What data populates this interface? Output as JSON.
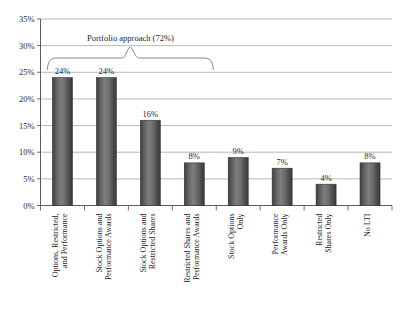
{
  "chart_data": {
    "type": "bar",
    "title": "",
    "subtitle": "",
    "xlabel": "",
    "ylabel": "",
    "ylim": [
      0,
      35
    ],
    "ytick_labels": [
      "0%",
      "5%",
      "10%",
      "15%",
      "20%",
      "25%",
      "30%",
      "35%"
    ],
    "ytick_values": [
      0,
      5,
      10,
      15,
      20,
      25,
      30,
      35
    ],
    "grid": true,
    "legend": "none",
    "categories": [
      "Options, Restricted, and Performance",
      "Stock Options and Performance Awards",
      "Stock Options and Restricted Shares",
      "Restricted Shares and Performance Awards",
      "Stock Options Only",
      "Performance Awards Only",
      "Restricted Shares Only",
      "No LTI"
    ],
    "category_lines": [
      [
        "Options, Restricted,",
        "and Performance"
      ],
      [
        "Stock Options and",
        "Performance Awards"
      ],
      [
        "Stock Options and",
        "Restricted Shares"
      ],
      [
        "Restricted Shares and",
        "Performance Awards"
      ],
      [
        "Stock Options",
        "Only"
      ],
      [
        "Performance",
        "Awards Only"
      ],
      [
        "Restricted",
        "Shares Only"
      ],
      [
        "No LTI"
      ]
    ],
    "values": [
      24,
      24,
      16,
      8,
      9,
      7,
      4,
      8
    ],
    "value_labels": [
      "24%",
      "24%",
      "16%",
      "8%",
      "9%",
      "7%",
      "4%",
      "8%"
    ],
    "annotations": [
      {
        "text": "Portfolio approach (72%)",
        "spans_categories": [
          0,
          1,
          2,
          3
        ],
        "value": "72%"
      }
    ],
    "colors": {
      "bar_fill_dark": "#4a4a4a",
      "bar_fill_light": "#7d7d7d",
      "bar_edge": "#333333",
      "gridline": "#9a9a9a",
      "axis": "#4a4a4a",
      "text": "#1f1f1f",
      "background": "#ffffff"
    }
  }
}
